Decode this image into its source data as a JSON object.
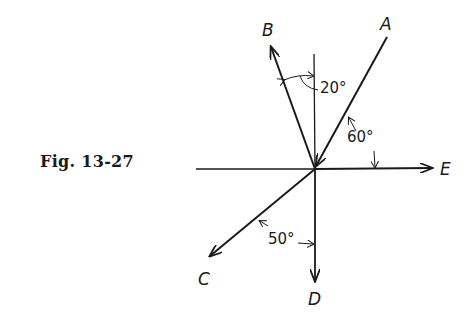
{
  "figure": {
    "caption": "Fig. 13-27",
    "origin": {
      "x": 315,
      "y": 169
    },
    "vectors": [
      {
        "name": "A",
        "label": "A",
        "direction": "toward origin from upper right",
        "angle_from_horizontal_deg": 60
      },
      {
        "name": "B",
        "label": "B",
        "direction": "upper left",
        "angle_from_vertical_deg": 20
      },
      {
        "name": "C",
        "label": "C",
        "direction": "lower left",
        "angle_from_vertical_deg": 50
      },
      {
        "name": "D",
        "label": "D",
        "direction": "down"
      },
      {
        "name": "E",
        "label": "E",
        "direction": "right"
      }
    ],
    "angle_labels": {
      "b_vertical": "20°",
      "a_horizontal": "60°",
      "c_vertical": "50°"
    },
    "colors": {
      "ink": "#1a1a1a",
      "background": "#ffffff"
    }
  }
}
